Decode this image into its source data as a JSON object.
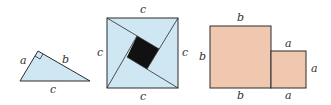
{
  "colors": {
    "triangle_fill": "#cfe7f3",
    "square_fill": "#cfe7f3",
    "inner_square_fill": "#111111",
    "rect_fill": "#f0c8b0",
    "stroke": "#2a2a2a"
  },
  "figure1": {
    "name": "right-triangle",
    "labels": {
      "leg_a": "a",
      "leg_b": "b",
      "hypotenuse": "c"
    }
  },
  "figure2": {
    "name": "square-of-hypotenuse",
    "labels": {
      "top": "c",
      "left": "c",
      "right": "c",
      "bottom": "c"
    }
  },
  "figure3": {
    "name": "two-squares",
    "labels": {
      "big_top": "b",
      "big_left": "b",
      "big_bottom": "b",
      "small_top": "a",
      "small_right": "a",
      "small_bottom": "a"
    }
  }
}
